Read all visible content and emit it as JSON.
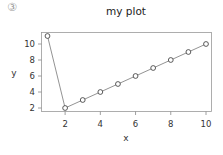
{
  "badge": "③",
  "chart_data": {
    "type": "line",
    "title": "my plot",
    "xlabel": "x",
    "ylabel": "y",
    "x": [
      1,
      2,
      3,
      4,
      5,
      6,
      7,
      8,
      9,
      10
    ],
    "series": [
      {
        "name": "y",
        "values": [
          11,
          2,
          3,
          4,
          5,
          6,
          7,
          8,
          9,
          10
        ]
      }
    ],
    "xlim": [
      1,
      10
    ],
    "ylim": [
      2,
      11
    ],
    "xticks": [
      2,
      4,
      6,
      8,
      10
    ],
    "yticks": [
      2,
      4,
      6,
      8,
      10
    ],
    "xtick_labels": [
      "2",
      "4",
      "6",
      "8",
      "10"
    ],
    "ytick_labels": [
      "2",
      "4",
      "6",
      "8",
      "10"
    ],
    "markers": "open-circle",
    "grid": false,
    "legend": "none",
    "line_color": "#777777",
    "marker_color": "#333333"
  }
}
